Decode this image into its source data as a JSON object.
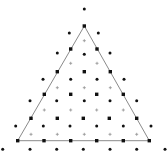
{
  "diagram": {
    "title": "",
    "width": 167,
    "height": 158,
    "colors": {
      "line": "#8a8a8a",
      "square": "#111111",
      "dot": "#111111",
      "plus": "#9a9a9a"
    },
    "triangle": [
      [
        84.3,
        26
      ],
      [
        17.7,
        140.7
      ],
      [
        149.3,
        140.7
      ]
    ],
    "squares": [
      [
        84.3,
        26
      ],
      [
        70.7,
        49
      ],
      [
        97,
        49
      ],
      [
        57.3,
        71.7
      ],
      [
        84.3,
        71.7
      ],
      [
        110.3,
        71.7
      ],
      [
        44.3,
        94.3
      ],
      [
        70.7,
        94.3
      ],
      [
        96.7,
        94.3
      ],
      [
        123.3,
        94.3
      ],
      [
        31,
        118.3
      ],
      [
        57.3,
        118.3
      ],
      [
        83.3,
        118.3
      ],
      [
        109.3,
        118.3
      ],
      [
        136.7,
        118.3
      ],
      [
        17.7,
        140.7
      ],
      [
        44,
        140.7
      ],
      [
        70.7,
        140.7
      ],
      [
        96.7,
        140.7
      ],
      [
        123.3,
        140.7
      ],
      [
        149.3,
        140.7
      ]
    ],
    "dots": [
      [
        84.3,
        9
      ],
      [
        69.3,
        33
      ],
      [
        98.3,
        33
      ],
      [
        57.3,
        53
      ],
      [
        84.3,
        54.3
      ],
      [
        110,
        53
      ],
      [
        43,
        79.3
      ],
      [
        70.7,
        79.3
      ],
      [
        97,
        79.3
      ],
      [
        124,
        79.3
      ],
      [
        30,
        100.7
      ],
      [
        56.7,
        100.7
      ],
      [
        84.3,
        100.7
      ],
      [
        110,
        100.7
      ],
      [
        136.7,
        100.7
      ],
      [
        15.7,
        126
      ],
      [
        43.3,
        126
      ],
      [
        70,
        126
      ],
      [
        96.7,
        126
      ],
      [
        123.3,
        126
      ],
      [
        151,
        126
      ],
      [
        2.7,
        149.3
      ],
      [
        30,
        149.3
      ],
      [
        56.7,
        149.3
      ],
      [
        83.3,
        149.3
      ],
      [
        110,
        149.3
      ],
      [
        136.7,
        149.3
      ],
      [
        165,
        149.3
      ]
    ],
    "pluses": [
      [
        84.3,
        40.7
      ],
      [
        70.7,
        63.3
      ],
      [
        97,
        63.3
      ],
      [
        57.3,
        87.7
      ],
      [
        84.3,
        87.7
      ],
      [
        110.3,
        87.7
      ],
      [
        44.3,
        110
      ],
      [
        70.7,
        110
      ],
      [
        96.7,
        110
      ],
      [
        123.3,
        110
      ],
      [
        31,
        134.3
      ],
      [
        57.3,
        134.3
      ],
      [
        84.3,
        134.3
      ],
      [
        110,
        134.3
      ],
      [
        136.7,
        134.3
      ]
    ],
    "legend": []
  }
}
